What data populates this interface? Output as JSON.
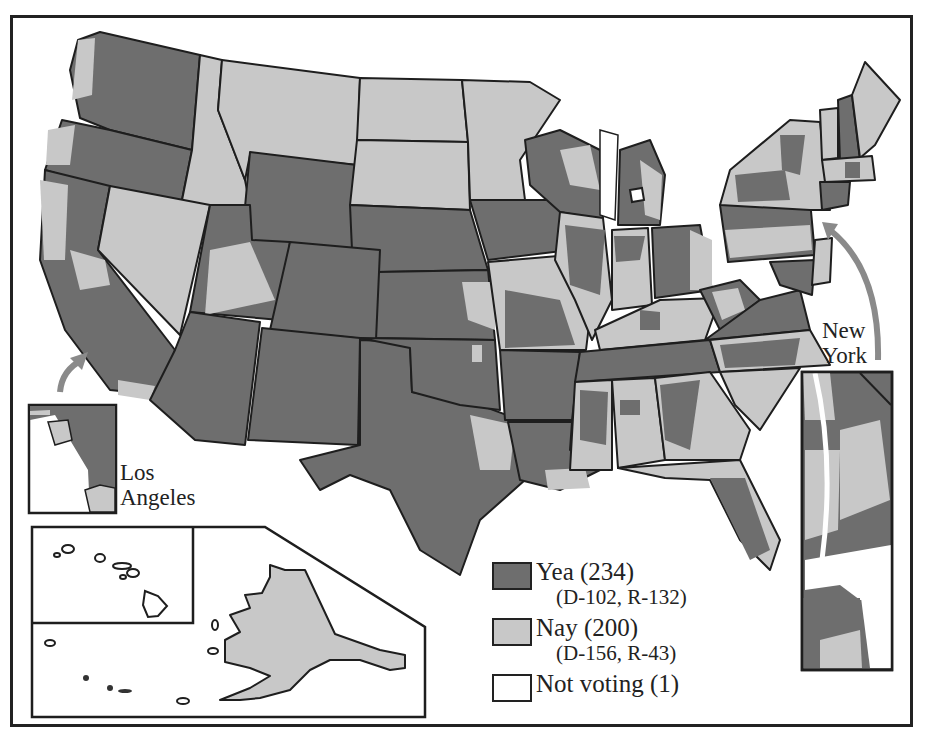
{
  "map": {
    "title": "",
    "colors": {
      "yea": "#6e6e6e",
      "nay": "#c8c8c8",
      "not_voting": "#ffffff",
      "border": "#1e1e1e",
      "arrow": "#8a8a8a"
    },
    "insets": {
      "los_angeles": {
        "label_line1": "Los",
        "label_line2": "Angeles"
      },
      "new_york": {
        "label_line1": "New",
        "label_line2": "York"
      },
      "hawaii": {
        "label": ""
      },
      "alaska": {
        "label": ""
      }
    },
    "legend": {
      "items": [
        {
          "key": "yea",
          "label": "Yea (234)",
          "sub": "(D-102, R-132)"
        },
        {
          "key": "nay",
          "label": "Nay (200)",
          "sub": "(D-156, R-43)"
        },
        {
          "key": "not_voting",
          "label": "Not voting (1)",
          "sub": ""
        }
      ]
    },
    "vote_totals": {
      "yea": 234,
      "yea_dem": 102,
      "yea_rep": 132,
      "nay": 200,
      "nay_dem": 156,
      "nay_rep": 43,
      "not_voting": 1
    }
  }
}
